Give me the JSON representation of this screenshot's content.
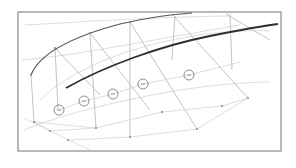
{
  "diagram": {
    "type": "wireframe-surface",
    "frame": {
      "x": 18,
      "y": 12,
      "w": 263,
      "h": 139,
      "stroke": "#8a8a8a"
    },
    "colors": {
      "guide": "#cfcfcf",
      "guide_mid": "#b4b4b4",
      "curve_upper": "#555555",
      "curve_lower": "#2e2e2e",
      "control": "#6e6e6e"
    },
    "curves": {
      "upper": "M31,75 C40,52 75,36 120,24 C150,17 175,14 192,13",
      "lower": "M66,88 C105,66 160,46 210,36 C240,30 262,26 278,24"
    },
    "control_circles": [
      {
        "cx": 59,
        "cy": 110,
        "r": 5
      },
      {
        "cx": 84,
        "cy": 101,
        "r": 5
      },
      {
        "cx": 113,
        "cy": 94,
        "r": 5
      },
      {
        "cx": 143,
        "cy": 84,
        "r": 5
      },
      {
        "cx": 189,
        "cy": 75,
        "r": 5
      }
    ],
    "nodes": [
      {
        "x": 34,
        "y": 122
      },
      {
        "x": 50,
        "y": 131
      },
      {
        "x": 68,
        "y": 140
      },
      {
        "x": 96,
        "y": 128
      },
      {
        "x": 130,
        "y": 137
      },
      {
        "x": 162,
        "y": 112
      },
      {
        "x": 197,
        "y": 129
      },
      {
        "x": 222,
        "y": 106
      },
      {
        "x": 248,
        "y": 98
      },
      {
        "x": 31,
        "y": 75
      },
      {
        "x": 55,
        "y": 48
      },
      {
        "x": 90,
        "y": 33
      },
      {
        "x": 130,
        "y": 22
      }
    ],
    "guide_lines": [
      "M31,75 L34,122",
      "M55,48 L58,110",
      "M90,33 L96,128",
      "M130,22 L130,137",
      "M175,16 L172,60",
      "M230,14 L232,70",
      "M55,48 L100,95",
      "M90,33 L150,110",
      "M130,22 L197,129",
      "M172,14 L248,98",
      "M226,14 L270,40",
      "M34,122 L68,140",
      "M68,140 L130,137",
      "M34,122 L96,128",
      "M96,128 L162,112",
      "M130,137 L197,129",
      "M162,112 L222,106",
      "M197,129 L248,98",
      "M222,106 L248,98",
      "M50,131 L96,128",
      "M59,110 L84,101 L113,94 L143,84 L189,75 L240,62",
      "M24,118 L50,131",
      "M68,140 L90,150"
    ],
    "guide_arcs": [
      "M40,100 C70,70 130,45 200,35 C230,31 255,30 270,31",
      "M24,130 C60,115 120,100 180,90 C220,84 250,82 270,82",
      "M22,60 C80,55 150,40 240,25",
      "M25,25 C80,22 150,17 230,16"
    ]
  }
}
